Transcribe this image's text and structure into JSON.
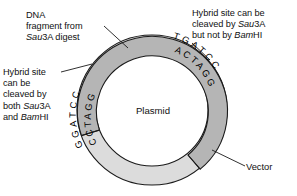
{
  "figure": {
    "background_color": "#ffffff"
  },
  "plasmid": {
    "center_label": "Plasmid",
    "vector_color": "#dcdcdc",
    "insert_color": "#b5b5b5",
    "outline_color": "#000000",
    "center_x": 152,
    "center_y": 110,
    "outer_radius": 75,
    "inner_radius": 56,
    "insert_arc_start_deg": 200,
    "insert_arc_end_deg": 50
  },
  "sequences": {
    "left_site": {
      "top_strand": "GGATCC",
      "bottom_strand": "CCTAGG",
      "angle_center_deg": 232
    },
    "right_site": {
      "top_strand": "TGATCC",
      "bottom_strand": "ACTAGG",
      "angle_center_deg": 310
    }
  },
  "labels": {
    "dna_fragment": {
      "name": "dna-fragment-label",
      "lines": [
        "DNA",
        "fragment from",
        "Sau3A digest"
      ],
      "italic_prefix": "Sau",
      "text": "DNA\nfragment from\nSau3A digest"
    },
    "hybrid_sau_only": {
      "name": "hybrid-sau-only-label",
      "lines": [
        "Hybrid site can be",
        "cleaved by Sau3A",
        "but not by BamHI"
      ],
      "text": "Hybrid site can be\ncleaved by Sau3A\nbut not by BamHI"
    },
    "hybrid_both": {
      "name": "hybrid-both-label",
      "lines": [
        "Hybrid site",
        "can be",
        "cleaved by",
        "both Sau3A",
        "and BamHI"
      ],
      "text": "Hybrid site\ncan be\ncleaved by\nboth Sau3A\nand BamHI"
    },
    "vector": {
      "name": "vector-label",
      "text": "Vector"
    }
  },
  "leader_lines": [
    {
      "name": "leader-dna-fragment",
      "x1": 104,
      "y1": 26,
      "x2": 126,
      "y2": 47
    },
    {
      "name": "leader-hybrid-both",
      "x1": 61,
      "y1": 72,
      "x2": 90,
      "y2": 64
    },
    {
      "name": "leader-hybrid-sau-only",
      "x1": 190,
      "y1": 42,
      "x2": 209,
      "y2": 59
    },
    {
      "name": "leader-vector",
      "x1": 245,
      "y1": 166,
      "x2": 214,
      "y2": 151
    }
  ]
}
